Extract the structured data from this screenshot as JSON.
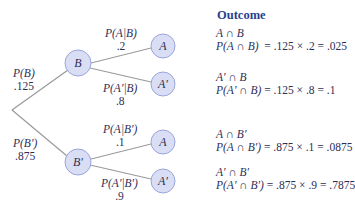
{
  "colors": {
    "node_fill": "#d9def4",
    "node_stroke": "#9aa6dc",
    "branch": "#9a9a9a",
    "title": "#2b3f8f",
    "text": "#2e2e55"
  },
  "outcome_header": "Outcome",
  "first_level": [
    {
      "label": "P(B)",
      "value": ".125",
      "node": "B"
    },
    {
      "label": "P(B′)",
      "value": ".875",
      "node": "B′"
    }
  ],
  "second_level": [
    {
      "label": "P(A|B)",
      "value": ".2",
      "node": "A"
    },
    {
      "label": "P(A′|B)",
      "value": ".8",
      "node": "A′"
    },
    {
      "label": "P(A|B′)",
      "value": ".1",
      "node": "A"
    },
    {
      "label": "P(A′|B′)",
      "value": ".9",
      "node": "A′"
    }
  ],
  "outcomes": [
    {
      "event": "A ∩ B",
      "prob": "P(A ∩ B)",
      "calc": "= .125 × .2 = .025"
    },
    {
      "event": "A′ ∩ B",
      "prob": "P(A′ ∩ B)",
      "calc": "= .125 × .8 = .1"
    },
    {
      "event": "A ∩ B′",
      "prob": "P(A ∩ B′)",
      "calc": "= .875 × .1 = .0875"
    },
    {
      "event": "A′ ∩ B′",
      "prob": "P(A′ ∩ B′)",
      "calc": "= .875 × .9 = .7875"
    }
  ]
}
